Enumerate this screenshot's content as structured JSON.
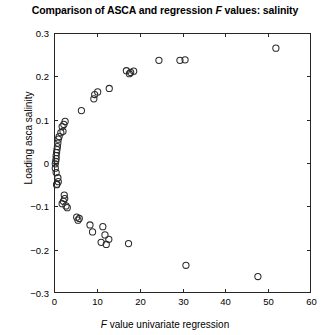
{
  "chart_data": {
    "type": "scatter",
    "title": "Comparison of ASCA and regression F values: salinity",
    "title_parts": {
      "before_italic": "Comparison of ASCA and regression ",
      "italic": "F",
      "after_italic": " values: salinity"
    },
    "xlabel": "F value univariate regression",
    "xlabel_parts": {
      "italic": "F",
      "rest": " value univariate regression"
    },
    "ylabel": "Loading asca salinity",
    "xlim": [
      0,
      60
    ],
    "ylim": [
      -0.3,
      0.3
    ],
    "xticks": [
      0,
      10,
      20,
      30,
      40,
      50,
      60
    ],
    "xticklabels": [
      "0",
      "10",
      "20",
      "30",
      "40",
      "50",
      "60"
    ],
    "yticks": [
      -0.3,
      -0.2,
      -0.1,
      0,
      0.1,
      0.2,
      0.3
    ],
    "yticklabels": [
      "−0.3",
      "−0.2",
      "−0.1",
      "0",
      "0.1",
      "0.2",
      "0.3"
    ],
    "grid": false,
    "legend": null,
    "marker": {
      "shape": "circle-open",
      "radius": 3.1,
      "edge_color": "#2b2b2b",
      "fill": "none",
      "line_width": 1.05
    },
    "axes_color": "#262626",
    "background_color": "#ffffff",
    "series": [
      {
        "name": "salinity variables",
        "points": [
          [
            51.8,
            0.265
          ],
          [
            30.6,
            0.238
          ],
          [
            29.4,
            0.237
          ],
          [
            24.5,
            0.237
          ],
          [
            18.6,
            0.212
          ],
          [
            17.9,
            0.209
          ],
          [
            17.6,
            0.206
          ],
          [
            16.9,
            0.213
          ],
          [
            12.9,
            0.172
          ],
          [
            10.2,
            0.164
          ],
          [
            9.5,
            0.158
          ],
          [
            9.3,
            0.148
          ],
          [
            6.4,
            0.121
          ],
          [
            2.6,
            0.096
          ],
          [
            2.3,
            0.089
          ],
          [
            1.9,
            0.084
          ],
          [
            2.1,
            0.073
          ],
          [
            1.6,
            0.07
          ],
          [
            1.2,
            0.061
          ],
          [
            1.0,
            0.055
          ],
          [
            0.9,
            0.046
          ],
          [
            0.8,
            0.038
          ],
          [
            0.7,
            0.031
          ],
          [
            0.6,
            0.024
          ],
          [
            0.5,
            0.017
          ],
          [
            0.5,
            0.01
          ],
          [
            0.4,
            0.004
          ],
          [
            0.3,
            -0.002
          ],
          [
            0.3,
            -0.012
          ],
          [
            0.5,
            -0.022
          ],
          [
            0.9,
            -0.034
          ],
          [
            1.0,
            -0.043
          ],
          [
            0.7,
            -0.049
          ],
          [
            0.6,
            -0.05
          ],
          [
            2.4,
            -0.074
          ],
          [
            2.5,
            -0.082
          ],
          [
            2.2,
            -0.088
          ],
          [
            1.9,
            -0.094
          ],
          [
            2.8,
            -0.099
          ],
          [
            3.1,
            -0.103
          ],
          [
            5.3,
            -0.125
          ],
          [
            5.9,
            -0.128
          ],
          [
            5.6,
            -0.132
          ],
          [
            8.4,
            -0.143
          ],
          [
            9.0,
            -0.159
          ],
          [
            11.4,
            -0.147
          ],
          [
            11.9,
            -0.166
          ],
          [
            12.8,
            -0.176
          ],
          [
            11.0,
            -0.183
          ],
          [
            12.2,
            -0.188
          ],
          [
            17.4,
            -0.186
          ],
          [
            30.8,
            -0.236
          ],
          [
            47.6,
            -0.262
          ]
        ]
      }
    ]
  },
  "geometry": {
    "plot_left": 54,
    "plot_right": 311,
    "plot_top": 33,
    "plot_bottom": 293
  }
}
